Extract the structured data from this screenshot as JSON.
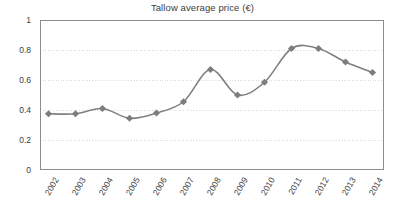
{
  "chart_data": {
    "type": "line",
    "title": "Tallow average price (€)",
    "xlabel": "",
    "ylabel": "",
    "categories": [
      "2002",
      "2003",
      "2004",
      "2005",
      "2006",
      "2007",
      "2008",
      "2009",
      "2010",
      "2011",
      "2012",
      "2013",
      "2014"
    ],
    "values": [
      0.375,
      0.375,
      0.41,
      0.345,
      0.38,
      0.455,
      0.67,
      0.5,
      0.585,
      0.81,
      0.81,
      0.72,
      0.65
    ],
    "series": [
      {
        "name": "Tallow average price",
        "values": [
          0.375,
          0.375,
          0.41,
          0.345,
          0.38,
          0.455,
          0.67,
          0.5,
          0.585,
          0.81,
          0.81,
          0.72,
          0.65
        ]
      }
    ],
    "ylim": [
      0,
      1
    ],
    "yticks": [
      0,
      0.2,
      0.4,
      0.6,
      0.8,
      1
    ],
    "ytick_labels": [
      "0",
      "0.2",
      "0.4",
      "0.6",
      "0.8",
      "1"
    ],
    "grid": true,
    "grid_axis": "y",
    "legend": false,
    "legend_position": "none",
    "marker": "diamond",
    "line_color": "#808080",
    "marker_color": "#7d7d7d",
    "grid_color": "#d9d9d9",
    "axis_color": "#8c8c8c",
    "text_color": "#3d3d3d",
    "background_color": "#ffffff"
  }
}
